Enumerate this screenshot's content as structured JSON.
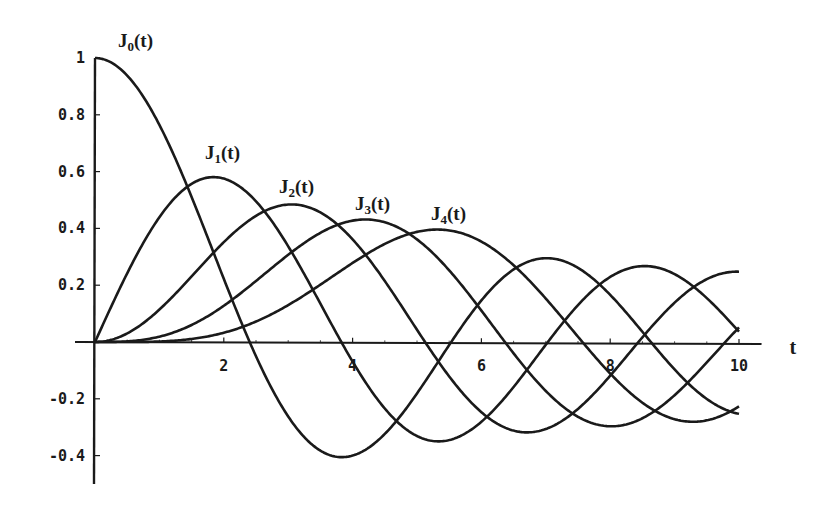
{
  "chart_data": {
    "type": "line",
    "title": "",
    "xlabel": "t",
    "ylabel": "",
    "xlim": [
      0,
      10
    ],
    "ylim": [
      -0.45,
      1.0
    ],
    "grid": false,
    "legend": "inline curve labels",
    "x_ticks": [
      2,
      4,
      6,
      8,
      10
    ],
    "x_tick_labels": [
      "2",
      "4",
      "6",
      "8",
      "10"
    ],
    "y_ticks": [
      1,
      0.8,
      0.6,
      0.4,
      0.2,
      -0.2,
      -0.4
    ],
    "y_tick_labels": [
      "1",
      "0.8",
      "0.6",
      "0.4",
      "0.2",
      "-0.2",
      "-0.4"
    ],
    "x": [
      0,
      1,
      2,
      3,
      4,
      5,
      6,
      7,
      8,
      9,
      10
    ],
    "series": [
      {
        "name": "J0(t)",
        "label_main": "J",
        "label_sub": "0",
        "label_tail": "(t)",
        "order": 0,
        "values": [
          1.0,
          0.765,
          0.224,
          -0.26,
          -0.397,
          -0.178,
          0.151,
          0.3,
          0.172,
          -0.09,
          -0.246
        ]
      },
      {
        "name": "J1(t)",
        "label_main": "J",
        "label_sub": "1",
        "label_tail": "(t)",
        "order": 1,
        "values": [
          0.0,
          0.44,
          0.577,
          0.339,
          -0.066,
          -0.328,
          -0.277,
          -0.005,
          0.235,
          0.245,
          0.043
        ]
      },
      {
        "name": "J2(t)",
        "label_main": "J",
        "label_sub": "2",
        "label_tail": "(t)",
        "order": 2,
        "values": [
          0.0,
          0.115,
          0.353,
          0.486,
          0.364,
          0.047,
          -0.243,
          -0.301,
          -0.113,
          0.145,
          0.255
        ]
      },
      {
        "name": "J3(t)",
        "label_main": "J",
        "label_sub": "3",
        "label_tail": "(t)",
        "order": 3,
        "values": [
          0.0,
          0.02,
          0.129,
          0.309,
          0.43,
          0.365,
          0.115,
          -0.168,
          -0.291,
          -0.181,
          0.058
        ]
      },
      {
        "name": "J4(t)",
        "label_main": "J",
        "label_sub": "4",
        "label_tail": "(t)",
        "order": 4,
        "values": [
          0.0,
          0.002,
          0.034,
          0.132,
          0.281,
          0.391,
          0.358,
          0.158,
          -0.105,
          -0.265,
          -0.22
        ]
      }
    ],
    "annotations": [
      {
        "text": "J0(t)",
        "near": "peak of J0 at t=0"
      },
      {
        "text": "J1(t)",
        "near": "peak of J1 at t≈1.84"
      },
      {
        "text": "J2(t)",
        "near": "peak of J2 at t≈3.05"
      },
      {
        "text": "J3(t)",
        "near": "peak of J3 at t≈4.2"
      },
      {
        "text": "J4(t)",
        "near": "peak of J4 at t≈5.3"
      }
    ]
  },
  "layout": {
    "origin_px": [
      95,
      342
    ],
    "px_per_t": 64.4,
    "px_per_y": 284,
    "x_axis_end_t": 10.35,
    "y_axis_top": 1.0,
    "y_axis_bottom": -0.5,
    "label_positions": [
      {
        "x": 118,
        "y": 47
      },
      {
        "x": 205,
        "y": 159
      },
      {
        "x": 279,
        "y": 193
      },
      {
        "x": 355,
        "y": 210
      },
      {
        "x": 431,
        "y": 220
      }
    ],
    "ink_color": "#1a1a1a"
  }
}
